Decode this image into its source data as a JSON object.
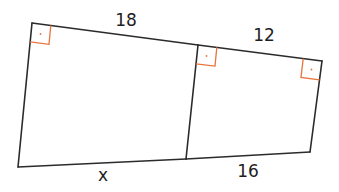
{
  "diagram": {
    "type": "geometry",
    "colors": {
      "edge": "#2b2b2b",
      "right_angle_marker": "#e8743b",
      "label": "#1e1e1e",
      "background": "#ffffff"
    },
    "vertices": {
      "top_left": [
        32,
        23
      ],
      "top_middle": [
        198,
        45
      ],
      "top_right": [
        322,
        61
      ],
      "bottom_left": [
        18,
        167
      ],
      "bottom_middle": [
        186,
        159
      ],
      "bottom_right": [
        310,
        152
      ]
    },
    "labels": {
      "top_left_segment": "18",
      "top_right_segment": "12",
      "bottom_left_segment": "x",
      "bottom_right_segment": "16"
    },
    "right_angles": [
      {
        "name": "top-left",
        "vertex": "top_left"
      },
      {
        "name": "top-middle",
        "vertex": "top_middle"
      },
      {
        "name": "top-right",
        "vertex": "top_right"
      }
    ]
  }
}
